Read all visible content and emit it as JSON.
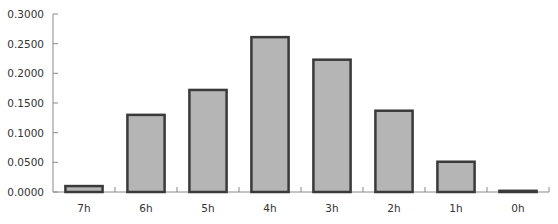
{
  "chart_data": {
    "type": "bar",
    "title": "",
    "xlabel": "",
    "ylabel": "",
    "categories": [
      "7h",
      "6h",
      "5h",
      "4h",
      "3h",
      "2h",
      "1h",
      "0h"
    ],
    "values": [
      0.01,
      0.13,
      0.172,
      0.261,
      0.223,
      0.137,
      0.051,
      0.002
    ],
    "ylim": [
      0,
      0.3
    ],
    "yticks": [
      0,
      0.05,
      0.1,
      0.15,
      0.2,
      0.25,
      0.3
    ],
    "ytick_labels": [
      "0.0000",
      "0.0500",
      "0.1000",
      "0.1500",
      "0.2000",
      "0.2500",
      "0.3000"
    ],
    "grid": false,
    "legend": "none",
    "colors": {
      "bar_fill": "#b5b5b5",
      "bar_stroke": "#3a3a3a",
      "axis": "#888888"
    }
  }
}
